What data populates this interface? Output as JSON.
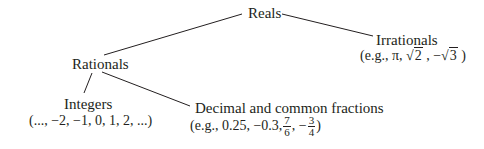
{
  "nodes": {
    "reals": {
      "label": "Reals"
    },
    "rationals": {
      "label": "Rationals"
    },
    "irrationals": {
      "label": "Irrationals",
      "example_prefix": "(e.g., π, ",
      "sqrt1": "2",
      "example_mid": " , −",
      "sqrt2": "3",
      "example_suffix": " )"
    },
    "integers": {
      "label": "Integers",
      "example": "(..., −2, −1, 0, 1, 2, ...)"
    },
    "fractions": {
      "label": "Decimal and common fractions",
      "example_prefix": "(e.g., 0.25, −0.3,",
      "frac1_num": "7",
      "frac1_den": "6",
      "example_mid": ", −",
      "frac2_num": "3",
      "frac2_den": "4",
      "example_suffix": ")"
    }
  },
  "edges": [
    {
      "from": "reals",
      "to": "rationals"
    },
    {
      "from": "reals",
      "to": "irrationals"
    },
    {
      "from": "rationals",
      "to": "integers"
    },
    {
      "from": "rationals",
      "to": "fractions"
    }
  ],
  "colors": {
    "ink": "#231f20"
  }
}
